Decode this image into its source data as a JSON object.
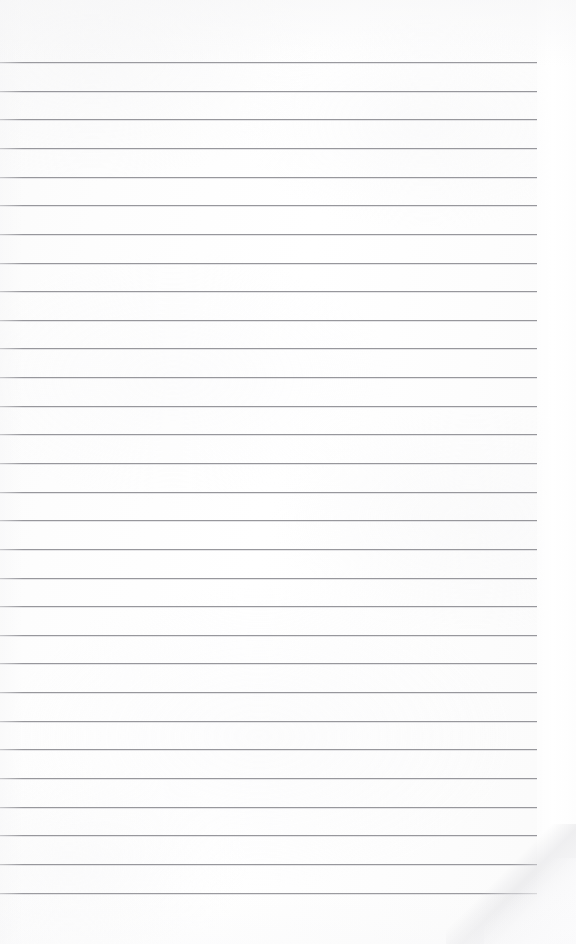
{
  "document": {
    "kind": "blank-ruled-paper-scan",
    "title": "",
    "body_text": "",
    "page_width": 576,
    "page_height": 944
  },
  "paper": {
    "background_color": "#fdfdfd",
    "rule_color": "#97979c",
    "rule_thickness_px": 1,
    "margin_color": "#ffffff",
    "has_margin_rule": false,
    "has_holes": false,
    "has_header_text": false
  },
  "ruling": {
    "line_count": 29,
    "first_line_y": 62,
    "spacing_px": 28.6,
    "line_start_x": 0,
    "line_end_x": 537,
    "top_margin_px": 62,
    "bottom_margin_px": 51,
    "right_margin_px": 39,
    "lines": [
      {
        "index": 1,
        "y": 62,
        "x1": 0,
        "x2": 537,
        "content": ""
      },
      {
        "index": 2,
        "y": 91,
        "x1": 0,
        "x2": 537,
        "content": ""
      },
      {
        "index": 3,
        "y": 119,
        "x1": 0,
        "x2": 537,
        "content": ""
      },
      {
        "index": 4,
        "y": 148,
        "x1": 0,
        "x2": 537,
        "content": ""
      },
      {
        "index": 5,
        "y": 177,
        "x1": 0,
        "x2": 537,
        "content": ""
      },
      {
        "index": 6,
        "y": 205,
        "x1": 0,
        "x2": 537,
        "content": ""
      },
      {
        "index": 7,
        "y": 234,
        "x1": 0,
        "x2": 537,
        "content": ""
      },
      {
        "index": 8,
        "y": 263,
        "x1": 0,
        "x2": 537,
        "content": ""
      },
      {
        "index": 9,
        "y": 291,
        "x1": 0,
        "x2": 537,
        "content": ""
      },
      {
        "index": 10,
        "y": 320,
        "x1": 0,
        "x2": 537,
        "content": ""
      },
      {
        "index": 11,
        "y": 348,
        "x1": 0,
        "x2": 537,
        "content": ""
      },
      {
        "index": 12,
        "y": 377,
        "x1": 0,
        "x2": 537,
        "content": ""
      },
      {
        "index": 13,
        "y": 406,
        "x1": 0,
        "x2": 537,
        "content": ""
      },
      {
        "index": 14,
        "y": 434,
        "x1": 0,
        "x2": 537,
        "content": ""
      },
      {
        "index": 15,
        "y": 463,
        "x1": 0,
        "x2": 537,
        "content": ""
      },
      {
        "index": 16,
        "y": 492,
        "x1": 0,
        "x2": 537,
        "content": ""
      },
      {
        "index": 17,
        "y": 520,
        "x1": 0,
        "x2": 537,
        "content": ""
      },
      {
        "index": 18,
        "y": 549,
        "x1": 0,
        "x2": 537,
        "content": ""
      },
      {
        "index": 19,
        "y": 578,
        "x1": 0,
        "x2": 537,
        "content": ""
      },
      {
        "index": 20,
        "y": 606,
        "x1": 0,
        "x2": 537,
        "content": ""
      },
      {
        "index": 21,
        "y": 635,
        "x1": 0,
        "x2": 537,
        "content": ""
      },
      {
        "index": 22,
        "y": 663,
        "x1": 0,
        "x2": 537,
        "content": ""
      },
      {
        "index": 23,
        "y": 692,
        "x1": 0,
        "x2": 537,
        "content": ""
      },
      {
        "index": 24,
        "y": 721,
        "x1": 0,
        "x2": 537,
        "content": ""
      },
      {
        "index": 25,
        "y": 749,
        "x1": 0,
        "x2": 537,
        "content": ""
      },
      {
        "index": 26,
        "y": 778,
        "x1": 0,
        "x2": 537,
        "content": ""
      },
      {
        "index": 27,
        "y": 807,
        "x1": 0,
        "x2": 537,
        "content": ""
      },
      {
        "index": 28,
        "y": 835,
        "x1": 0,
        "x2": 537,
        "content": ""
      },
      {
        "index": 29,
        "y": 864,
        "x1": 0,
        "x2": 537,
        "content": ""
      },
      {
        "index": 30,
        "y": 893,
        "x1": 0,
        "x2": 537,
        "content": ""
      }
    ]
  },
  "artifacts": {
    "corner_fold": {
      "corner": "bottom-right",
      "width": 130,
      "height": 120
    }
  }
}
